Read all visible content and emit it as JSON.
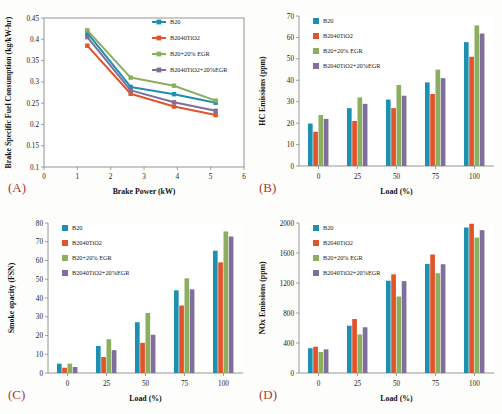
{
  "figure": {
    "panels": [
      "(A)",
      "(B)",
      "(C)",
      "(D)"
    ]
  },
  "series_colors": {
    "B20": "#1f8fb0",
    "B2040TiO2": "#e0542a",
    "B20+20% EGR": "#8cae5f",
    "B2040TiO2+20%EGR": "#7f6f9a"
  },
  "legend_labels": [
    "B20",
    "B2040TiO2",
    "B20+20% EGR",
    "B2040TiO2+20%EGR"
  ],
  "chart_data": [
    {
      "id": "A",
      "panel_label": "(A)",
      "type": "line",
      "title": "",
      "xlabel": "Brake Power (kW)",
      "ylabel": "Brake Specific Fuel Consumption (kg/kW-hr)",
      "xlim": [
        0,
        6
      ],
      "ylim": [
        0.1,
        0.45
      ],
      "xticks": [
        0,
        1,
        2,
        3,
        4,
        5,
        6
      ],
      "xticklabels": [
        "0",
        "1",
        "2",
        "3",
        "4",
        "5",
        "6"
      ],
      "yticks": [
        0.1,
        0.15,
        0.2,
        0.25,
        0.3,
        0.35,
        0.4,
        0.45
      ],
      "yticklabels": [
        "0.1",
        "0.15",
        "0.2",
        "0.25",
        "0.3",
        "0.35",
        "0.4",
        "0.45"
      ],
      "grid": false,
      "legend_position": "top-right",
      "x": [
        1.3,
        2.6,
        3.9,
        5.15
      ],
      "series": [
        {
          "name": "B20",
          "values": [
            0.415,
            0.288,
            0.271,
            0.251
          ]
        },
        {
          "name": "B2040TiO2",
          "values": [
            0.385,
            0.272,
            0.242,
            0.222
          ]
        },
        {
          "name": "B20+20% EGR",
          "values": [
            0.421,
            0.31,
            0.291,
            0.256
          ]
        },
        {
          "name": "B2040TiO2+20%EGR",
          "values": [
            0.405,
            0.28,
            0.252,
            0.232
          ]
        }
      ]
    },
    {
      "id": "B",
      "panel_label": "(B)",
      "type": "bar",
      "title": "",
      "xlabel": "Load (%)",
      "ylabel": "HC Emissions (ppm)",
      "categories": [
        "0",
        "25",
        "50",
        "75",
        "100"
      ],
      "ylim": [
        0,
        70
      ],
      "yticks": [
        0,
        10,
        20,
        30,
        40,
        50,
        60,
        70
      ],
      "yticklabels": [
        "0",
        "10",
        "20",
        "30",
        "40",
        "50",
        "60",
        "70"
      ],
      "grid": false,
      "legend_position": "top-left",
      "series": [
        {
          "name": "B20",
          "values": [
            19.8,
            27.0,
            31.0,
            39.0,
            57.8
          ]
        },
        {
          "name": "B2040TiO2",
          "values": [
            16.0,
            21.0,
            27.0,
            33.6,
            51.0
          ]
        },
        {
          "name": "B20+20% EGR",
          "values": [
            23.8,
            32.0,
            37.8,
            45.0,
            65.6
          ]
        },
        {
          "name": "B2040TiO2+20%EGR",
          "values": [
            22.0,
            29.0,
            32.8,
            41.0,
            61.8
          ]
        }
      ]
    },
    {
      "id": "C",
      "panel_label": "(C)",
      "type": "bar",
      "title": "",
      "xlabel": "Load (%)",
      "ylabel": "Smoke opacity (FSN)",
      "categories": [
        "0",
        "25",
        "50",
        "75",
        "100"
      ],
      "ylim": [
        0,
        80
      ],
      "yticks": [
        0,
        10,
        20,
        30,
        40,
        50,
        60,
        70,
        80
      ],
      "yticklabels": [
        "0",
        "10",
        "20",
        "30",
        "40",
        "50",
        "60",
        "70",
        "80"
      ],
      "grid": false,
      "legend_position": "top-left",
      "series": [
        {
          "name": "B20",
          "values": [
            5.0,
            14.4,
            27.1,
            44.1,
            65.2
          ]
        },
        {
          "name": "B2040TiO2",
          "values": [
            2.8,
            8.5,
            16.1,
            36.0,
            59.0
          ]
        },
        {
          "name": "B20+20% EGR",
          "values": [
            5.0,
            18.0,
            32.0,
            50.5,
            75.5
          ]
        },
        {
          "name": "B2040TiO2+20%EGR",
          "values": [
            3.2,
            12.2,
            20.4,
            44.6,
            72.8
          ]
        }
      ]
    },
    {
      "id": "D",
      "panel_label": "(D)",
      "type": "bar",
      "title": "",
      "xlabel": "Load (%)",
      "ylabel": "NOx Emissions (ppm)",
      "categories": [
        "0",
        "25",
        "50",
        "75",
        "100"
      ],
      "ylim": [
        0,
        2000
      ],
      "yticks": [
        0,
        400,
        800,
        1200,
        1600,
        2000
      ],
      "yticklabels": [
        "0",
        "400",
        "800",
        "1200",
        "1600",
        "2000"
      ],
      "grid": false,
      "legend_position": "top-left",
      "series": [
        {
          "name": "B20",
          "values": [
            330,
            630,
            1230,
            1455,
            1940
          ]
        },
        {
          "name": "B2040TiO2",
          "values": [
            350,
            720,
            1315,
            1580,
            1990
          ]
        },
        {
          "name": "B20+20% EGR",
          "values": [
            280,
            515,
            1020,
            1330,
            1805
          ]
        },
        {
          "name": "B2040TiO2+20%EGR",
          "values": [
            315,
            610,
            1225,
            1450,
            1905
          ]
        }
      ]
    }
  ]
}
